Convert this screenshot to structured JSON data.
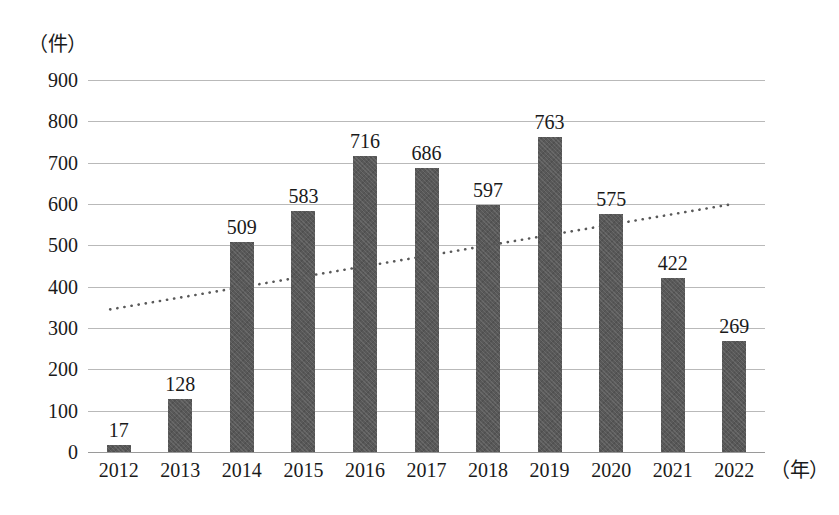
{
  "chart_data": {
    "type": "bar",
    "title": "",
    "subtitle": "",
    "xlabel": "（年）",
    "ylabel": "（件）",
    "categories": [
      "2012",
      "2013",
      "2014",
      "2015",
      "2016",
      "2017",
      "2018",
      "2019",
      "2020",
      "2021",
      "2022"
    ],
    "values": [
      17,
      128,
      509,
      583,
      716,
      686,
      597,
      763,
      575,
      422,
      269
    ],
    "data_labels": [
      "17",
      "128",
      "509",
      "583",
      "716",
      "686",
      "597",
      "763",
      "575",
      "422",
      "269"
    ],
    "ylim": [
      0,
      900
    ],
    "ytick_values": [
      0,
      100,
      200,
      300,
      400,
      500,
      600,
      700,
      800,
      900
    ],
    "ytick_labels": [
      "0",
      "100",
      "200",
      "300",
      "400",
      "500",
      "600",
      "700",
      "800",
      "900"
    ],
    "grid": true,
    "legend": "none",
    "series": [
      {
        "name": "件数",
        "type": "bar",
        "values": [
          17,
          128,
          509,
          583,
          716,
          686,
          597,
          763,
          575,
          422,
          269
        ],
        "color": "#585858"
      },
      {
        "name": "近似直線（点線）",
        "type": "line",
        "style": "dotted",
        "color": "#595959",
        "start_value": 345,
        "end_value": 600
      }
    ],
    "colors": {
      "bar": "#585858",
      "gridline": "#b9b9b9",
      "axis": "#9a9a9a",
      "text": "#1a1a1a",
      "trendline": "#595959",
      "background": "#ffffff"
    }
  },
  "axes": {
    "y_unit": "（件）",
    "x_unit": "（年）"
  }
}
